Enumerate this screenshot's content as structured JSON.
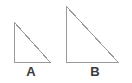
{
  "figure": {
    "name": "two-right-triangles",
    "background_color": "#ffffff",
    "width": 132,
    "height": 83,
    "stroke_color": "#9a9a9a",
    "fill_color": "#ffffff",
    "stroke_width": 1,
    "label_color": "#3a3a3a"
  },
  "shapes": [
    {
      "id": "triangle-a",
      "label": "A",
      "type": "right-triangle",
      "right_angle_corner": "bottom-left",
      "points": "14,22 14,62 50,62",
      "base_px": 36,
      "height_px": 40
    },
    {
      "id": "triangle-b",
      "label": "B",
      "type": "right-triangle",
      "right_angle_corner": "bottom-left",
      "points": "66,6 66,62 118,62",
      "base_px": 52,
      "height_px": 56
    }
  ],
  "labels": {
    "a": "A",
    "b": "B"
  }
}
